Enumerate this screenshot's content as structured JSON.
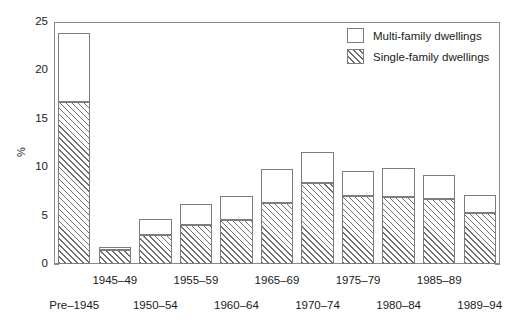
{
  "chart_data": {
    "type": "bar",
    "subtype": "stacked-vertical",
    "title": "",
    "xlabel": "",
    "ylabel": "%",
    "ylim": [
      0,
      25
    ],
    "yticks": [
      0,
      5,
      10,
      15,
      20,
      25
    ],
    "ytick_labels": [
      "0",
      "5",
      "10",
      "15",
      "20",
      "25"
    ],
    "grid": false,
    "legend_position": "top-right",
    "categories": [
      "Pre-1945",
      "1945-49",
      "1950-54",
      "1955-59",
      "1960-64",
      "1965-69",
      "1970-74",
      "1975-79",
      "1980-84",
      "1985-89",
      "1989-94"
    ],
    "category_labels_display": [
      "Pre–1945",
      "1945–49",
      "1950–54",
      "1955–59",
      "1960–64",
      "1965–69",
      "1970–74",
      "1975–79",
      "1980–84",
      "1985–89",
      "1989–94"
    ],
    "series": [
      {
        "name": "Single-family dwellings",
        "pattern": "diagonal-hatch",
        "values": [
          16.7,
          1.4,
          3.0,
          4.0,
          4.5,
          6.3,
          8.4,
          7.0,
          6.9,
          6.7,
          5.3
        ]
      },
      {
        "name": "Multi-family dwellings",
        "pattern": "solid-white",
        "values": [
          7.2,
          0.4,
          1.7,
          2.2,
          2.5,
          3.5,
          3.2,
          2.6,
          3.0,
          2.5,
          1.8
        ]
      }
    ],
    "totals": [
      23.9,
      1.8,
      4.7,
      6.2,
      7.0,
      9.8,
      11.6,
      9.6,
      9.9,
      9.2,
      7.1
    ]
  },
  "legend": {
    "items": [
      {
        "label": "Multi-family dwellings",
        "swatch": "multi"
      },
      {
        "label": "Single-family dwellings",
        "swatch": "single"
      }
    ]
  },
  "axis": {
    "y_title": "%"
  },
  "colors": {
    "frame": "#8a8a8a",
    "bar_outline": "#7d7d7d",
    "hatch": "#6f6f6f",
    "background": "#ffffff",
    "text": "#1a1a1a"
  }
}
